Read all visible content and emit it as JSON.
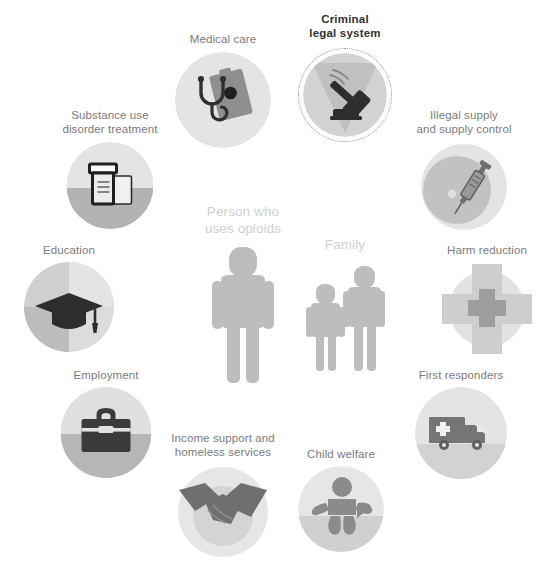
{
  "diagram": {
    "type": "ecosystem-hub-and-spoke",
    "title_visible": false,
    "center": {
      "person": {
        "label": "Person who uses opioids",
        "label_lines": [
          "Person who",
          "uses opioids"
        ],
        "icon": "person-figure"
      },
      "family": {
        "label": "Family",
        "label_lines": [
          "Family"
        ],
        "icon": "family-figures"
      }
    },
    "highlighted_node": "Criminal legal system",
    "colors": {
      "background": "#ffffff",
      "label_text": "#7b7b7b",
      "highlight_text": "#2f3233",
      "center_label_text": "#cfcfcf",
      "center_figure": "#bcbcbc",
      "disc_light": "#e3e3e3",
      "disc_mid": "#c9c9c9",
      "disc_dark": "#b4b4b4",
      "icon_dark": "#3a3a3a",
      "icon_mid": "#8c8c8c",
      "dotted_ring": "#8e8e8e"
    },
    "nodes": [
      {
        "id": "medical-care",
        "label": "Medical care",
        "label_lines": [
          "Medical care"
        ],
        "icon": "stethoscope-clipboard-icon",
        "highlighted": false
      },
      {
        "id": "criminal-legal-system",
        "label": "Criminal legal system",
        "label_lines": [
          "Criminal",
          "legal system"
        ],
        "icon": "gavel-icon",
        "highlighted": true
      },
      {
        "id": "substance-use-disorder-treatment",
        "label": "Substance use disorder treatment",
        "label_lines": [
          "Substance use",
          "disorder treatment"
        ],
        "icon": "pill-bottle-icon",
        "highlighted": false
      },
      {
        "id": "illegal-supply-and-supply-control",
        "label": "Illegal supply and supply control",
        "label_lines": [
          "Illegal supply",
          "and supply control"
        ],
        "icon": "syringe-icon",
        "highlighted": false
      },
      {
        "id": "education",
        "label": "Education",
        "label_lines": [
          "Education"
        ],
        "icon": "graduation-cap-icon",
        "highlighted": false
      },
      {
        "id": "harm-reduction",
        "label": "Harm reduction",
        "label_lines": [
          "Harm reduction"
        ],
        "icon": "medical-cross-icon",
        "highlighted": false
      },
      {
        "id": "employment",
        "label": "Employment",
        "label_lines": [
          "Employment"
        ],
        "icon": "briefcase-icon",
        "highlighted": false
      },
      {
        "id": "first-responders",
        "label": "First responders",
        "label_lines": [
          "First responders"
        ],
        "icon": "ambulance-icon",
        "highlighted": false
      },
      {
        "id": "income-support-and-homeless-services",
        "label": "Income support and homeless services",
        "label_lines": [
          "Income support and",
          "homeless services"
        ],
        "icon": "handshake-icon",
        "highlighted": false
      },
      {
        "id": "child-welfare",
        "label": "Child welfare",
        "label_lines": [
          "Child welfare"
        ],
        "icon": "baby-icon",
        "highlighted": false
      }
    ]
  }
}
